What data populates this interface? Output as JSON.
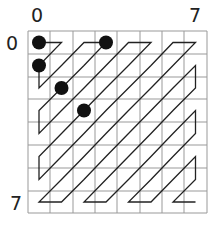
{
  "labels": {
    "col_start": "0",
    "col_end": "7",
    "row_start": "0",
    "row_end": "7"
  },
  "grid": {
    "size": 8,
    "x_lines": [
      28,
      50,
      73,
      95,
      117,
      140,
      162,
      184,
      207
    ],
    "y_lines": [
      31,
      54,
      77,
      99,
      122,
      145,
      168,
      191,
      213
    ],
    "color": "#999999"
  },
  "path": {
    "color": "#222222",
    "type": "zigzag-scan"
  },
  "dots": [
    {
      "row": 0,
      "col": 0
    },
    {
      "row": 1,
      "col": 0
    },
    {
      "row": 0,
      "col": 3
    },
    {
      "row": 2,
      "col": 1
    },
    {
      "row": 3,
      "col": 2
    }
  ],
  "dot_color": "#111111"
}
